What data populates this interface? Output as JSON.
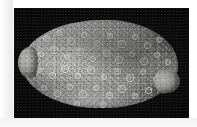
{
  "figure": {
    "kind": "specimen-photograph",
    "medium": "black-and-white photographic plate",
    "caption": "",
    "background_color": "#060606",
    "page_color": "#ffffff",
    "plate": {
      "x": 14,
      "y": 8,
      "width": 175,
      "height": 110
    }
  },
  "subject": {
    "description": "Dorsal view of an oval, heavily tuberculate marine invertebrate specimen",
    "common_interpretation": "dorid nudibranch / flatworm-like mollusc, dorsal aspect",
    "orientation": "anterior to the left, posterior to the right",
    "body": {
      "label": "dorsal mantle",
      "shape": "broad ellipse",
      "surface_texture": "dense granular tubercles with scattered ring-shaped papillae",
      "tone_light": "#b9b9b7",
      "tone_mid": "#8e8e8c",
      "tone_dark": "#6a6a68"
    },
    "anterior_lobe": {
      "label": "anterior lobe",
      "shape": "rounded knob projecting from the left margin"
    },
    "posterior_flap": {
      "label": "posterior flap",
      "shape": "small rounded appendage on the lower right margin"
    },
    "mantle_margin": {
      "label": "mantle margin"
    }
  },
  "tubercles": [
    {
      "x": 23,
      "y": 17,
      "d": 5.0
    },
    {
      "x": 36,
      "y": 12,
      "d": 4.2
    },
    {
      "x": 48,
      "y": 20,
      "d": 5.4
    },
    {
      "x": 61,
      "y": 14,
      "d": 4.6
    },
    {
      "x": 74,
      "y": 22,
      "d": 5.0
    },
    {
      "x": 87,
      "y": 15,
      "d": 4.4
    },
    {
      "x": 99,
      "y": 23,
      "d": 5.2
    },
    {
      "x": 112,
      "y": 16,
      "d": 4.6
    },
    {
      "x": 124,
      "y": 24,
      "d": 5.0
    },
    {
      "x": 136,
      "y": 19,
      "d": 4.4
    },
    {
      "x": 18,
      "y": 33,
      "d": 4.8
    },
    {
      "x": 31,
      "y": 29,
      "d": 5.2
    },
    {
      "x": 44,
      "y": 36,
      "d": 4.4
    },
    {
      "x": 57,
      "y": 31,
      "d": 5.6
    },
    {
      "x": 70,
      "y": 38,
      "d": 4.8
    },
    {
      "x": 83,
      "y": 32,
      "d": 5.0
    },
    {
      "x": 96,
      "y": 39,
      "d": 5.4
    },
    {
      "x": 109,
      "y": 33,
      "d": 4.6
    },
    {
      "x": 121,
      "y": 40,
      "d": 5.2
    },
    {
      "x": 134,
      "y": 34,
      "d": 4.8
    },
    {
      "x": 145,
      "y": 41,
      "d": 4.2
    },
    {
      "x": 16,
      "y": 49,
      "d": 4.6
    },
    {
      "x": 29,
      "y": 54,
      "d": 5.0
    },
    {
      "x": 42,
      "y": 48,
      "d": 5.4
    },
    {
      "x": 55,
      "y": 55,
      "d": 4.6
    },
    {
      "x": 68,
      "y": 49,
      "d": 5.2
    },
    {
      "x": 81,
      "y": 56,
      "d": 4.8
    },
    {
      "x": 94,
      "y": 50,
      "d": 5.0
    },
    {
      "x": 107,
      "y": 57,
      "d": 5.4
    },
    {
      "x": 120,
      "y": 51,
      "d": 4.6
    },
    {
      "x": 133,
      "y": 58,
      "d": 5.0
    },
    {
      "x": 146,
      "y": 52,
      "d": 4.4
    },
    {
      "x": 21,
      "y": 67,
      "d": 4.4
    },
    {
      "x": 34,
      "y": 72,
      "d": 5.0
    },
    {
      "x": 47,
      "y": 66,
      "d": 4.8
    },
    {
      "x": 60,
      "y": 73,
      "d": 5.2
    },
    {
      "x": 73,
      "y": 67,
      "d": 4.6
    },
    {
      "x": 86,
      "y": 74,
      "d": 5.0
    },
    {
      "x": 99,
      "y": 68,
      "d": 5.4
    },
    {
      "x": 112,
      "y": 75,
      "d": 4.8
    },
    {
      "x": 125,
      "y": 69,
      "d": 5.0
    },
    {
      "x": 138,
      "y": 74,
      "d": 4.4
    },
    {
      "x": 28,
      "y": 84,
      "d": 4.2
    },
    {
      "x": 41,
      "y": 88,
      "d": 4.8
    },
    {
      "x": 54,
      "y": 83,
      "d": 4.4
    },
    {
      "x": 67,
      "y": 89,
      "d": 5.0
    },
    {
      "x": 80,
      "y": 84,
      "d": 4.6
    },
    {
      "x": 93,
      "y": 90,
      "d": 4.8
    },
    {
      "x": 106,
      "y": 85,
      "d": 4.4
    },
    {
      "x": 119,
      "y": 89,
      "d": 4.8
    },
    {
      "x": 131,
      "y": 84,
      "d": 4.2
    }
  ]
}
